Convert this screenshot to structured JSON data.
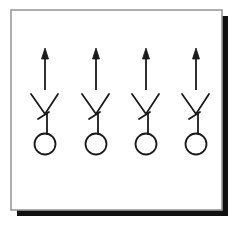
{
  "document": {
    "title": "Framed drawing of four identical arrow-and-circle symbols",
    "background_color": "#ffffff",
    "width": 244,
    "height": 230
  },
  "frame": {
    "name": "picture-frame",
    "x": 11,
    "y": 10,
    "width": 211,
    "height": 200,
    "border_color": "#9a9a9a",
    "border_width": 1.6,
    "fill_color": "#ffffff",
    "shadow": {
      "color": "#111111",
      "offset_x": 6,
      "offset_y": 6,
      "thickness": 6
    }
  },
  "artwork": {
    "name": "symbol-row",
    "stroke_color": "#1a1a1a",
    "stroke_width": 1.8,
    "count": 4,
    "symbol_name": "arrow-v-circle-symbol",
    "symbols": [
      {
        "label": "symbol-1",
        "center_x": 45,
        "arrow": {
          "x": 45,
          "y_top": 48,
          "y_bottom": 90,
          "head_width": 7,
          "head_height": 11
        },
        "vee": {
          "left_x": 31,
          "right_x": 58,
          "top_y": 94,
          "apex_x": 45,
          "apex_y": 114
        },
        "stem": {
          "x": 47,
          "y_top": 113,
          "y_bottom": 134
        },
        "flag": {
          "x1": 38,
          "y1": 119,
          "x2": 49,
          "y2": 112
        },
        "circle": {
          "cx": 45,
          "cy": 144,
          "r": 10.5
        }
      },
      {
        "label": "symbol-2",
        "center_x": 96,
        "arrow": {
          "x": 96,
          "y_top": 48,
          "y_bottom": 90,
          "head_width": 7,
          "head_height": 11
        },
        "vee": {
          "left_x": 82,
          "right_x": 109,
          "top_y": 94,
          "apex_x": 96,
          "apex_y": 114
        },
        "stem": {
          "x": 98,
          "y_top": 113,
          "y_bottom": 134
        },
        "flag": {
          "x1": 89,
          "y1": 119,
          "x2": 100,
          "y2": 112
        },
        "circle": {
          "cx": 96,
          "cy": 144,
          "r": 10.5
        }
      },
      {
        "label": "symbol-3",
        "center_x": 146,
        "arrow": {
          "x": 146,
          "y_top": 48,
          "y_bottom": 90,
          "head_width": 7,
          "head_height": 11
        },
        "vee": {
          "left_x": 132,
          "right_x": 159,
          "top_y": 94,
          "apex_x": 146,
          "apex_y": 114
        },
        "stem": {
          "x": 148,
          "y_top": 113,
          "y_bottom": 134
        },
        "flag": {
          "x1": 139,
          "y1": 119,
          "x2": 150,
          "y2": 112
        },
        "circle": {
          "cx": 146,
          "cy": 144,
          "r": 10.5
        }
      },
      {
        "label": "symbol-4",
        "center_x": 196,
        "arrow": {
          "x": 196,
          "y_top": 48,
          "y_bottom": 90,
          "head_width": 7,
          "head_height": 11
        },
        "vee": {
          "left_x": 182,
          "right_x": 209,
          "top_y": 94,
          "apex_x": 196,
          "apex_y": 114
        },
        "stem": {
          "x": 198,
          "y_top": 113,
          "y_bottom": 134
        },
        "flag": {
          "x1": 189,
          "y1": 119,
          "x2": 200,
          "y2": 112
        },
        "circle": {
          "cx": 196,
          "cy": 144,
          "r": 10.5
        }
      }
    ]
  }
}
